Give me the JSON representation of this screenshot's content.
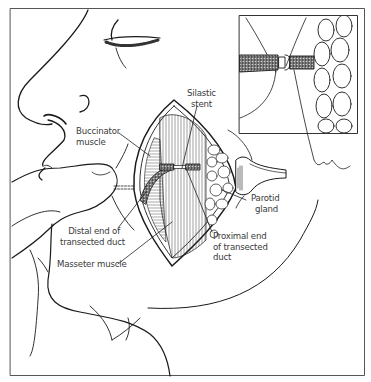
{
  "figure": {
    "line_color": "#1a1a1a",
    "label_color": "#3a3a3a",
    "background": "#ffffff"
  },
  "labels": {
    "silastic_stent": [
      "Silastic",
      "stent"
    ],
    "buccinator_muscle": [
      "Buccinator",
      "muscle"
    ],
    "parotid_gland": [
      "Parotid",
      "gland"
    ],
    "distal_end": [
      "Distal end of",
      "transected duct"
    ],
    "proximal_end": [
      "Proximal end",
      "of transected",
      "duct"
    ],
    "masseter_muscle": [
      "Masseter muscle"
    ]
  },
  "inset": {
    "description": "Magnified detail of duct ends joined over stent adjacent to parotid lobules"
  }
}
